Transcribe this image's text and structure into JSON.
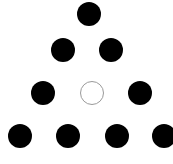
{
  "diagram": {
    "type": "triangular-dot-pattern",
    "rows": [
      {
        "y": 14,
        "dots": [
          {
            "x": 89,
            "filled": true
          }
        ]
      },
      {
        "y": 50,
        "dots": [
          {
            "x": 63,
            "filled": true
          },
          {
            "x": 111,
            "filled": true
          }
        ]
      },
      {
        "y": 93,
        "dots": [
          {
            "x": 43,
            "filled": true
          },
          {
            "x": 92,
            "filled": false
          },
          {
            "x": 140,
            "filled": true
          }
        ]
      },
      {
        "y": 136,
        "dots": [
          {
            "x": 20,
            "filled": true
          },
          {
            "x": 68,
            "filled": true
          },
          {
            "x": 117,
            "filled": true
          },
          {
            "x": 164,
            "filled": true
          }
        ]
      }
    ],
    "radius": 12,
    "colors": {
      "filled": "#000000",
      "empty_border": "#9a9a9a",
      "background": "#ffffff"
    }
  }
}
